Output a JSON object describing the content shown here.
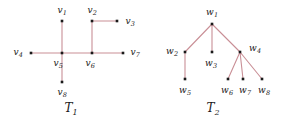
{
  "figure": {
    "width": 285,
    "height": 124,
    "background": "#ffffff",
    "edge_color": "#c98f96",
    "vertex_color": "#1a1a1a",
    "label_color": "#1a1a1a",
    "edge_width": 1.1,
    "vertex_size": 2.6
  },
  "chart_data": {
    "type": "diagram",
    "title": "",
    "subtitle": "",
    "graphs": [
      {
        "id": "T1",
        "caption": "T",
        "caption_sub": "1",
        "caption_x": 71,
        "caption_y": 108,
        "nodes": [
          {
            "id": "v1",
            "label": "v",
            "sub": "1",
            "x": 62,
            "y": 21,
            "label_x": 62,
            "label_y": 10,
            "label_anchor": "above"
          },
          {
            "id": "v2",
            "label": "v",
            "sub": "2",
            "x": 92,
            "y": 21,
            "label_x": 92,
            "label_y": 10,
            "label_anchor": "above"
          },
          {
            "id": "v3",
            "label": "v",
            "sub": "3",
            "x": 117,
            "y": 21,
            "label_x": 130,
            "label_y": 21,
            "label_anchor": "right"
          },
          {
            "id": "v4",
            "label": "v",
            "sub": "4",
            "x": 31,
            "y": 53,
            "label_x": 18,
            "label_y": 52,
            "label_anchor": "left"
          },
          {
            "id": "v5",
            "label": "v",
            "sub": "5",
            "x": 62,
            "y": 53,
            "label_x": 58,
            "label_y": 63,
            "label_anchor": "below"
          },
          {
            "id": "v6",
            "label": "v",
            "sub": "6",
            "x": 92,
            "y": 53,
            "label_x": 90,
            "label_y": 63,
            "label_anchor": "below"
          },
          {
            "id": "v7",
            "label": "v",
            "sub": "7",
            "x": 123,
            "y": 53,
            "label_x": 135,
            "label_y": 52,
            "label_anchor": "right"
          },
          {
            "id": "v8",
            "label": "v",
            "sub": "8",
            "x": 62,
            "y": 82,
            "label_x": 62,
            "label_y": 92,
            "label_anchor": "below"
          }
        ],
        "edges": [
          {
            "from": "v1",
            "to": "v5"
          },
          {
            "from": "v2",
            "to": "v3"
          },
          {
            "from": "v2",
            "to": "v6"
          },
          {
            "from": "v4",
            "to": "v5"
          },
          {
            "from": "v5",
            "to": "v6"
          },
          {
            "from": "v6",
            "to": "v7"
          },
          {
            "from": "v5",
            "to": "v8"
          }
        ]
      },
      {
        "id": "T2",
        "caption": "T",
        "caption_sub": "2",
        "caption_x": 213,
        "caption_y": 108,
        "nodes": [
          {
            "id": "w1",
            "label": "w",
            "sub": "1",
            "x": 212,
            "y": 24,
            "label_x": 212,
            "label_y": 12,
            "label_anchor": "above"
          },
          {
            "id": "w2",
            "label": "w",
            "sub": "2",
            "x": 185,
            "y": 52,
            "label_x": 172,
            "label_y": 51,
            "label_anchor": "left"
          },
          {
            "id": "w3",
            "label": "w",
            "sub": "3",
            "x": 212,
            "y": 52,
            "label_x": 211,
            "label_y": 63,
            "label_anchor": "below"
          },
          {
            "id": "w4",
            "label": "w",
            "sub": "4",
            "x": 240,
            "y": 52,
            "label_x": 255,
            "label_y": 48,
            "label_anchor": "right"
          },
          {
            "id": "w5",
            "label": "w",
            "sub": "5",
            "x": 185,
            "y": 79,
            "label_x": 185,
            "label_y": 90,
            "label_anchor": "below"
          },
          {
            "id": "w6",
            "label": "w",
            "sub": "6",
            "x": 228,
            "y": 79,
            "label_x": 227,
            "label_y": 90,
            "label_anchor": "below"
          },
          {
            "id": "w7",
            "label": "w",
            "sub": "7",
            "x": 243,
            "y": 79,
            "label_x": 245,
            "label_y": 90,
            "label_anchor": "below"
          },
          {
            "id": "w8",
            "label": "w",
            "sub": "8",
            "x": 262,
            "y": 79,
            "label_x": 264,
            "label_y": 90,
            "label_anchor": "below"
          }
        ],
        "edges": [
          {
            "from": "w1",
            "to": "w2"
          },
          {
            "from": "w1",
            "to": "w3"
          },
          {
            "from": "w1",
            "to": "w4"
          },
          {
            "from": "w2",
            "to": "w5"
          },
          {
            "from": "w4",
            "to": "w6"
          },
          {
            "from": "w4",
            "to": "w7"
          },
          {
            "from": "w4",
            "to": "w8"
          }
        ]
      }
    ]
  }
}
